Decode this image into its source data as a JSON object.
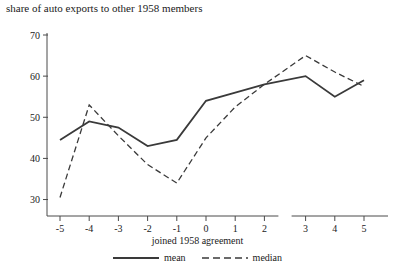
{
  "chart_data": {
    "type": "line",
    "title": "share of auto exports to other 1958 members",
    "xlabel": "joined 1958 agreement",
    "ylabel": "",
    "x": [
      -5,
      -4,
      -3,
      -2,
      -1,
      0,
      1,
      2,
      3,
      4,
      5
    ],
    "xticklabels": [
      "-5",
      "-4",
      "-3",
      "-2",
      "-1",
      "0",
      "1",
      "2",
      "3",
      "4",
      "5"
    ],
    "yticks": [
      30,
      40,
      50,
      60,
      70
    ],
    "yticklabels": [
      "30",
      "40",
      "50",
      "60",
      "70"
    ],
    "ylim": [
      26,
      71
    ],
    "grid": false,
    "axis_break_between": [
      2,
      3
    ],
    "legend_position": "bottom-center",
    "series": [
      {
        "name": "mean",
        "style": "solid",
        "color": "#3a3a3a",
        "values": [
          44.5,
          49.0,
          47.5,
          43.0,
          44.5,
          54.0,
          56.0,
          58.0,
          60.0,
          55.0,
          59.0
        ]
      },
      {
        "name": "median",
        "style": "dashed",
        "color": "#3a3a3a",
        "values": [
          30.5,
          53.0,
          45.5,
          38.5,
          34.0,
          45.0,
          52.5,
          58.0,
          65.0,
          61.0,
          57.5
        ]
      }
    ]
  },
  "legend": {
    "entries": [
      {
        "label": "mean",
        "style": "solid"
      },
      {
        "label": "median",
        "style": "dashed"
      }
    ]
  }
}
